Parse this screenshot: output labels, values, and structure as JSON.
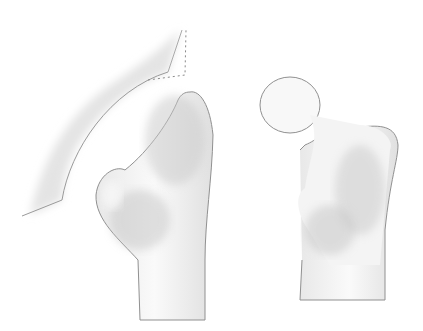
{
  "illustration": {
    "subject": "proximal femur illustrations",
    "panels": [
      {
        "id": "left",
        "description": "femur without head beside acetabulum (pelvis) with dotted outline"
      },
      {
        "id": "right",
        "description": "proximal femur with head and neck"
      }
    ],
    "colors": {
      "background": "#ffffff",
      "bone_shade": "#b8b8b8",
      "outline": "#8a8a8a"
    }
  }
}
